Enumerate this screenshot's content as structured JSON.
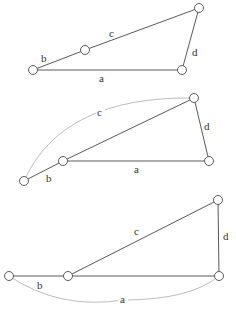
{
  "colors": {
    "edge": "#5a5a5a",
    "arc": "#bdbdbd",
    "node_fill": "#ffffff",
    "label": "#333333"
  },
  "diagrams": [
    {
      "name": "linkage-1",
      "labels": {
        "a": "a",
        "b": "b",
        "c": "c",
        "d": "d"
      }
    },
    {
      "name": "linkage-2",
      "labels": {
        "a": "a",
        "b": "b",
        "c": "c",
        "d": "d"
      }
    },
    {
      "name": "linkage-3",
      "labels": {
        "a": "a",
        "b": "b",
        "c": "c",
        "d": "d"
      }
    }
  ]
}
